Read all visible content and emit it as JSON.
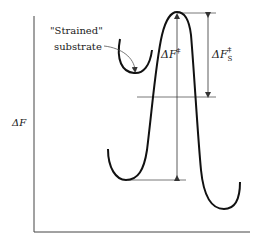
{
  "figure": {
    "type": "free-energy reaction coordinate diagram",
    "y_axis_label": "ΔF",
    "x_axis_label": "",
    "annotations": {
      "strained_line1": "\"Strained\"",
      "strained_line2": "substrate",
      "barrier_label_main": "ΔF",
      "barrier_label_main_sup": "‡",
      "barrier_label_strained": "ΔF",
      "barrier_label_strained_sub": "S",
      "barrier_label_strained_sup": "‡"
    },
    "colors": {
      "curve": "#111111",
      "guide_lines": "#555555",
      "axis": "#444444"
    }
  }
}
